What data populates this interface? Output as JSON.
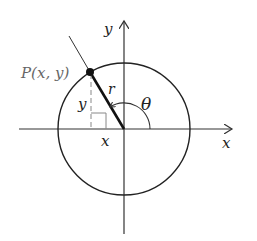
{
  "diagram": {
    "labels": {
      "point": "P(x, y)",
      "x_axis": "x",
      "y_axis": "y",
      "x_leg": "x",
      "y_leg": "y",
      "radius": "r",
      "angle": "θ"
    },
    "geometry": {
      "origin": [
        124,
        129
      ],
      "radius": 66,
      "point_P": [
        90,
        72
      ]
    },
    "colors": {
      "stroke": "#222222",
      "dashed": "#888888",
      "point_label": "#666666"
    }
  }
}
